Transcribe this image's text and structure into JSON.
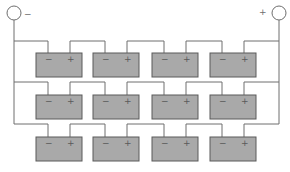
{
  "diagram": {
    "terminals": {
      "negative": {
        "label": "−"
      },
      "positive": {
        "label": "+"
      }
    },
    "rows": [
      {
        "name": "string-1",
        "batteries": [
          {
            "neg": "−",
            "pos": "+"
          },
          {
            "neg": "−",
            "pos": "+"
          },
          {
            "neg": "−",
            "pos": "+"
          },
          {
            "neg": "−",
            "pos": "+"
          }
        ]
      },
      {
        "name": "string-2",
        "batteries": [
          {
            "neg": "−",
            "pos": "+"
          },
          {
            "neg": "−",
            "pos": "+"
          },
          {
            "neg": "−",
            "pos": "+"
          },
          {
            "neg": "−",
            "pos": "+"
          }
        ]
      },
      {
        "name": "string-3",
        "batteries": [
          {
            "neg": "−",
            "pos": "+"
          },
          {
            "neg": "−",
            "pos": "+"
          },
          {
            "neg": "−",
            "pos": "+"
          },
          {
            "neg": "−",
            "pos": "+"
          }
        ]
      }
    ],
    "colors": {
      "battery_fill": "#a9a9a9",
      "wire": "#6e6e6e"
    }
  }
}
